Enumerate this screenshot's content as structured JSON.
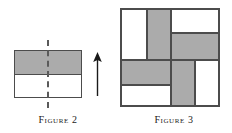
{
  "colors": {
    "gray_fill": "#ababab",
    "white_fill": "#ffffff",
    "stroke": "#4c4c4c",
    "text": "#1a1a1a",
    "background": "#ffffff"
  },
  "figures": [
    {
      "id": "figure-2",
      "caption": "Figure 2",
      "description": "A rectangle divided into two equal horizontal halves; the top half is shaded gray and the bottom half is white. A dashed vertical line marks the midline of the rectangle, and an upward arrow is drawn to the right of the rectangle.",
      "shape": "rectangle",
      "parts": [
        {
          "name": "top-half",
          "fill": "gray"
        },
        {
          "name": "bottom-half",
          "fill": "white"
        }
      ],
      "annotations": [
        {
          "name": "dashed-midline",
          "type": "dashed-line",
          "orientation": "vertical"
        },
        {
          "name": "up-arrow",
          "type": "arrow",
          "direction": "up"
        }
      ]
    },
    {
      "id": "figure-3",
      "caption": "Figure 3",
      "description": "A square dissected into eight rectangular tiles arranged in a pinwheel pattern, alternating gray and white fills.",
      "shape": "square",
      "tiles": [
        {
          "name": "top-left-white",
          "fill": "white"
        },
        {
          "name": "top-left-gray",
          "fill": "gray"
        },
        {
          "name": "top-right-white",
          "fill": "white"
        },
        {
          "name": "top-right-gray",
          "fill": "gray"
        },
        {
          "name": "bottom-left-gray",
          "fill": "gray"
        },
        {
          "name": "bottom-left-white",
          "fill": "white"
        },
        {
          "name": "bottom-center-gray",
          "fill": "gray"
        },
        {
          "name": "bottom-right-white",
          "fill": "white"
        }
      ]
    }
  ]
}
